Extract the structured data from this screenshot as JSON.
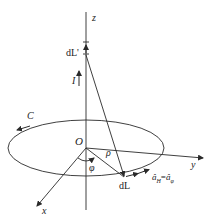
{
  "diagram": {
    "labels": {
      "z_axis": "z",
      "y_axis": "y",
      "x_axis": "x",
      "origin": "O",
      "current": "I",
      "source_element": "dL'",
      "field_element": "dL",
      "loop": "C",
      "radius": "ρ",
      "angle": "φ",
      "unit_vector": "âH=âφ"
    },
    "unit_vector_parts": {
      "lhs_base": "â",
      "lhs_sub": "H",
      "eq": "=",
      "rhs_base": "â",
      "rhs_sub": "φ"
    },
    "colors": {
      "stroke": "#2a2a2a",
      "background": "#ffffff"
    }
  }
}
